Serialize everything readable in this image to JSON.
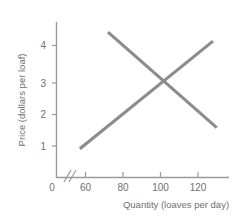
{
  "chart_data": {
    "type": "line",
    "title": "",
    "xlabel": "Quantity (loaves per day)",
    "ylabel": "Price (dollars per loaf)",
    "xlim": [
      50,
      135
    ],
    "ylim": [
      0,
      4.7
    ],
    "grid": false,
    "legend": false,
    "axis_break_x": true,
    "xticks": [
      0,
      60,
      80,
      100,
      120
    ],
    "xtick_labels": [
      "0",
      "60",
      "80",
      "100",
      "120"
    ],
    "yticks": [
      1,
      2,
      3,
      4
    ],
    "ytick_labels": [
      "1",
      "2",
      "3",
      "4"
    ],
    "line_color": "#8c8c8c",
    "axis_color": "#9a9a9a",
    "text_color": "#6f6f6f",
    "equilibrium": {
      "quantity": 100,
      "price": 3
    },
    "series": [
      {
        "name": "supply",
        "shape": "upward-sloping",
        "points": [
          {
            "x": 57,
            "y": 0.92
          },
          {
            "x": 128,
            "y": 4.13
          }
        ]
      },
      {
        "name": "demand",
        "shape": "downward-sloping",
        "points": [
          {
            "x": 72,
            "y": 4.4
          },
          {
            "x": 130,
            "y": 1.55
          }
        ]
      }
    ]
  },
  "axes": {
    "y_label": "Price (dollars per loaf)",
    "x_label": "Quantity (loaves per day)",
    "y_tick_1": "1",
    "y_tick_2": "2",
    "y_tick_3": "3",
    "y_tick_4": "4",
    "x_tick_0": "0",
    "x_tick_60": "60",
    "x_tick_80": "80",
    "x_tick_100": "100",
    "x_tick_120": "120"
  }
}
